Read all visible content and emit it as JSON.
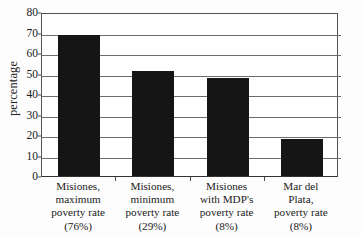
{
  "chart_data": {
    "type": "bar",
    "title": "",
    "xlabel": "",
    "ylabel": "percentage",
    "ylim": [
      0,
      80
    ],
    "ytick_step": 10,
    "grid": true,
    "legend": false,
    "yticks": [
      "80",
      "70",
      "60",
      "50",
      "40",
      "30",
      "20",
      "10",
      "0"
    ],
    "categories": [
      "Misiones, maximum poverty rate (76%)",
      "Misiones, minimum poverty rate (29%)",
      "Misiones with MDP's poverty rate (8%)",
      "Mar del Plata, poverty rate (8%)"
    ],
    "category_lines": [
      [
        "Misiones,",
        "maximum",
        "poverty rate",
        "(76%)"
      ],
      [
        "Misiones,",
        "minimum",
        "poverty rate",
        "(29%)"
      ],
      [
        "Misiones",
        "with MDP's",
        "poverty rate",
        "(8%)"
      ],
      [
        "Mar del",
        "Plata,",
        "poverty rate",
        "(8%)"
      ]
    ],
    "values": [
      69,
      51,
      48,
      18
    ],
    "bar_color": "#151515",
    "grid_color": "#6d6d6d",
    "axis_color": "#555555"
  }
}
